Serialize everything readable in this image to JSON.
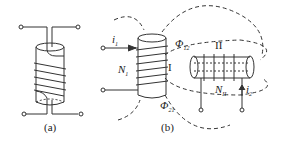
{
  "figure": {
    "panels": [
      {
        "id": "a",
        "caption": "(a)",
        "description": "coil wound on cylindrical core with four terminals"
      },
      {
        "id": "b",
        "caption": "(b)",
        "description": "two coupled coils with mutual magnetic flux lines"
      }
    ],
    "labels": {
      "i1": "i",
      "i1_sub": "1",
      "N1": "N",
      "N1_sub": "1",
      "coil1": "I",
      "phi12": "Φ",
      "phi12_sub": "12",
      "phi21": "Φ",
      "phi21_sub": "21",
      "coil2": "II",
      "N2": "N",
      "N2_sub": "II",
      "i2": "i",
      "i2_sub": "2",
      "caption_a": "(a)",
      "caption_b": "(b)"
    },
    "colors": {
      "line": "#333333",
      "background": "#ffffff"
    }
  }
}
